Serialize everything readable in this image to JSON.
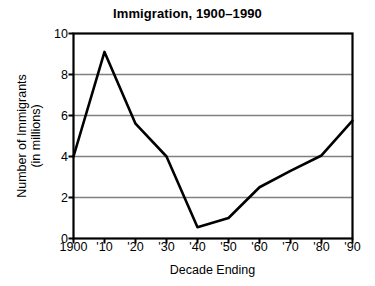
{
  "chart_data": {
    "type": "line",
    "title": "Immigration, 1900–1990",
    "xlabel": "Decade Ending",
    "ylabel": "Number of Immigrants (in millions)",
    "ylabel_line1": "Number of Immigrants",
    "ylabel_line2": "(in millions)",
    "categories": [
      "1900",
      "'10",
      "'20",
      "'30",
      "'40",
      "'50",
      "'60",
      "'70",
      "'80",
      "'90"
    ],
    "values": [
      4.0,
      9.1,
      5.6,
      4.0,
      0.55,
      1.0,
      2.5,
      3.3,
      4.05,
      5.75
    ],
    "x": [
      1900,
      1910,
      1920,
      1930,
      1940,
      1950,
      1960,
      1970,
      1980,
      1990
    ],
    "ylim": [
      0,
      10
    ],
    "ytick_labels": [
      "0",
      "2",
      "4",
      "6",
      "8",
      "10"
    ],
    "yticks": [
      0,
      2,
      4,
      6,
      8,
      10
    ],
    "grid": "horizontal-gridlines-at-2-4-6-8",
    "legend": "none",
    "series_name": "Number of Immigrants (in millions)",
    "line_color": "#000000",
    "grid_color": "#808080",
    "axis_color": "#000000",
    "background_color": "#ffffff"
  }
}
